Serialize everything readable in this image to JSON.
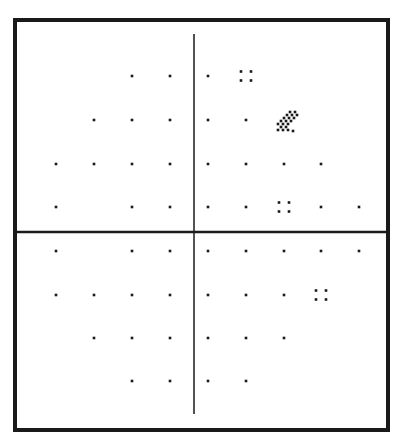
{
  "chart_data": {
    "type": "scatter",
    "title": "",
    "subtitle": "Visual field probability symbol plot",
    "xlabel": "",
    "ylabel": "",
    "grid": false,
    "legend": [],
    "frame": {
      "x": 15,
      "y": 20,
      "width": 373,
      "height": 410,
      "stroke_width": 4,
      "color": "#1a1a1a"
    },
    "axes": {
      "vertical": {
        "x": 194,
        "y1": 34,
        "y2": 414,
        "stroke_width": 1.5
      },
      "horizontal": {
        "y": 232,
        "x1": 15,
        "x2": 388,
        "stroke_width": 2.5
      }
    },
    "columns_x": [
      56,
      94,
      132,
      170,
      208,
      246,
      284,
      321,
      359
    ],
    "rows_y": [
      76,
      120,
      164,
      207,
      251,
      295,
      338,
      381
    ],
    "symbol_legend": {
      "dot": "normal (not significant)",
      "four_dot": "p < 5%",
      "checker": "p < 1%"
    },
    "points": [
      {
        "row": 0,
        "col": 2,
        "symbol": "dot"
      },
      {
        "row": 0,
        "col": 3,
        "symbol": "dot"
      },
      {
        "row": 0,
        "col": 4,
        "symbol": "dot"
      },
      {
        "row": 0,
        "col": 5,
        "symbol": "four_dot"
      },
      {
        "row": 1,
        "col": 1,
        "symbol": "dot"
      },
      {
        "row": 1,
        "col": 2,
        "symbol": "dot"
      },
      {
        "row": 1,
        "col": 3,
        "symbol": "dot"
      },
      {
        "row": 1,
        "col": 4,
        "symbol": "dot"
      },
      {
        "row": 1,
        "col": 5,
        "symbol": "dot"
      },
      {
        "row": 1,
        "col": 6,
        "symbol": "checker"
      },
      {
        "row": 2,
        "col": 0,
        "symbol": "dot"
      },
      {
        "row": 2,
        "col": 1,
        "symbol": "dot"
      },
      {
        "row": 2,
        "col": 2,
        "symbol": "dot"
      },
      {
        "row": 2,
        "col": 3,
        "symbol": "dot"
      },
      {
        "row": 2,
        "col": 4,
        "symbol": "dot"
      },
      {
        "row": 2,
        "col": 5,
        "symbol": "dot"
      },
      {
        "row": 2,
        "col": 6,
        "symbol": "dot"
      },
      {
        "row": 2,
        "col": 7,
        "symbol": "dot"
      },
      {
        "row": 3,
        "col": 0,
        "symbol": "dot"
      },
      {
        "row": 3,
        "col": 2,
        "symbol": "dot"
      },
      {
        "row": 3,
        "col": 3,
        "symbol": "dot"
      },
      {
        "row": 3,
        "col": 4,
        "symbol": "dot"
      },
      {
        "row": 3,
        "col": 5,
        "symbol": "dot"
      },
      {
        "row": 3,
        "col": 6,
        "symbol": "four_dot"
      },
      {
        "row": 3,
        "col": 7,
        "symbol": "dot"
      },
      {
        "row": 3,
        "col": 8,
        "symbol": "dot"
      },
      {
        "row": 4,
        "col": 0,
        "symbol": "dot"
      },
      {
        "row": 4,
        "col": 2,
        "symbol": "dot"
      },
      {
        "row": 4,
        "col": 3,
        "symbol": "dot"
      },
      {
        "row": 4,
        "col": 4,
        "symbol": "dot"
      },
      {
        "row": 4,
        "col": 5,
        "symbol": "dot"
      },
      {
        "row": 4,
        "col": 6,
        "symbol": "dot"
      },
      {
        "row": 4,
        "col": 7,
        "symbol": "dot"
      },
      {
        "row": 4,
        "col": 8,
        "symbol": "dot"
      },
      {
        "row": 5,
        "col": 0,
        "symbol": "dot"
      },
      {
        "row": 5,
        "col": 1,
        "symbol": "dot"
      },
      {
        "row": 5,
        "col": 2,
        "symbol": "dot"
      },
      {
        "row": 5,
        "col": 3,
        "symbol": "dot"
      },
      {
        "row": 5,
        "col": 4,
        "symbol": "dot"
      },
      {
        "row": 5,
        "col": 5,
        "symbol": "dot"
      },
      {
        "row": 5,
        "col": 6,
        "symbol": "dot"
      },
      {
        "row": 5,
        "col": 7,
        "symbol": "four_dot"
      },
      {
        "row": 6,
        "col": 1,
        "symbol": "dot"
      },
      {
        "row": 6,
        "col": 2,
        "symbol": "dot"
      },
      {
        "row": 6,
        "col": 3,
        "symbol": "dot"
      },
      {
        "row": 6,
        "col": 4,
        "symbol": "dot"
      },
      {
        "row": 6,
        "col": 5,
        "symbol": "dot"
      },
      {
        "row": 6,
        "col": 6,
        "symbol": "dot"
      },
      {
        "row": 7,
        "col": 2,
        "symbol": "dot"
      },
      {
        "row": 7,
        "col": 3,
        "symbol": "dot"
      },
      {
        "row": 7,
        "col": 4,
        "symbol": "dot"
      },
      {
        "row": 7,
        "col": 5,
        "symbol": "dot"
      }
    ],
    "colors": {
      "ink": "#1a1a1a",
      "background": "#ffffff"
    }
  }
}
